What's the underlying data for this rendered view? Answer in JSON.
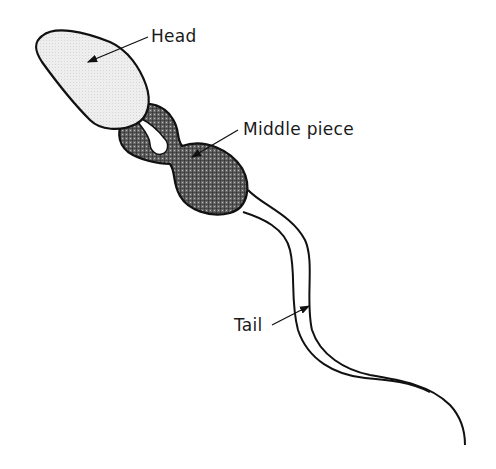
{
  "diagram": {
    "labels": {
      "head": "Head",
      "middle_piece": "Middle piece",
      "tail": "Tail"
    },
    "colors": {
      "outline": "#111111",
      "head_fill": "#ececec",
      "middle_fill": "#5a5a5a",
      "background": "#ffffff"
    }
  }
}
